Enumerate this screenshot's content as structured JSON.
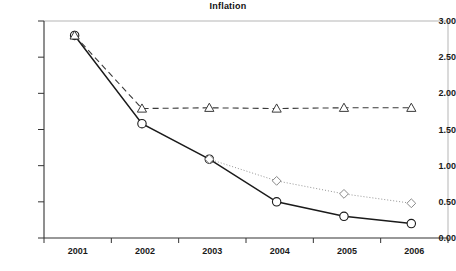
{
  "chart_data": {
    "type": "line",
    "title": "Inflation",
    "xlabel": "",
    "ylabel": "",
    "categories": [
      "2001",
      "2002",
      "2003",
      "2004",
      "2005",
      "2006"
    ],
    "ylim": [
      0.0,
      3.0
    ],
    "yticks": [
      "0.00",
      "0.50",
      "1.00",
      "1.50",
      "2.00",
      "2.50",
      "3.00"
    ],
    "ytick_values": [
      0.0,
      0.5,
      1.0,
      1.5,
      2.0,
      2.5,
      3.0
    ],
    "grid": false,
    "legend": "none",
    "series": [
      {
        "name": "actual",
        "marker": "circle",
        "line_style": "solid",
        "color": "#1a1a1a",
        "x": [
          "2001",
          "2002",
          "2003",
          "2004",
          "2005",
          "2006"
        ],
        "values": [
          2.8,
          1.58,
          1.09,
          0.5,
          0.3,
          0.2
        ]
      },
      {
        "name": "flat-projection",
        "marker": "triangle",
        "line_style": "dashed",
        "color": "#3a3a3a",
        "x": [
          "2001",
          "2002",
          "2003",
          "2004",
          "2005",
          "2006"
        ],
        "values": [
          2.8,
          1.79,
          1.8,
          1.79,
          1.8,
          1.8
        ]
      },
      {
        "name": "alt-projection",
        "marker": "diamond",
        "line_style": "dotted",
        "color": "#888888",
        "x": [
          "2003",
          "2004",
          "2005",
          "2006"
        ],
        "values": [
          1.09,
          0.79,
          0.61,
          0.48
        ]
      }
    ]
  },
  "axes": {
    "frame_color": "#b0b0b0",
    "axis_color": "#333333"
  }
}
